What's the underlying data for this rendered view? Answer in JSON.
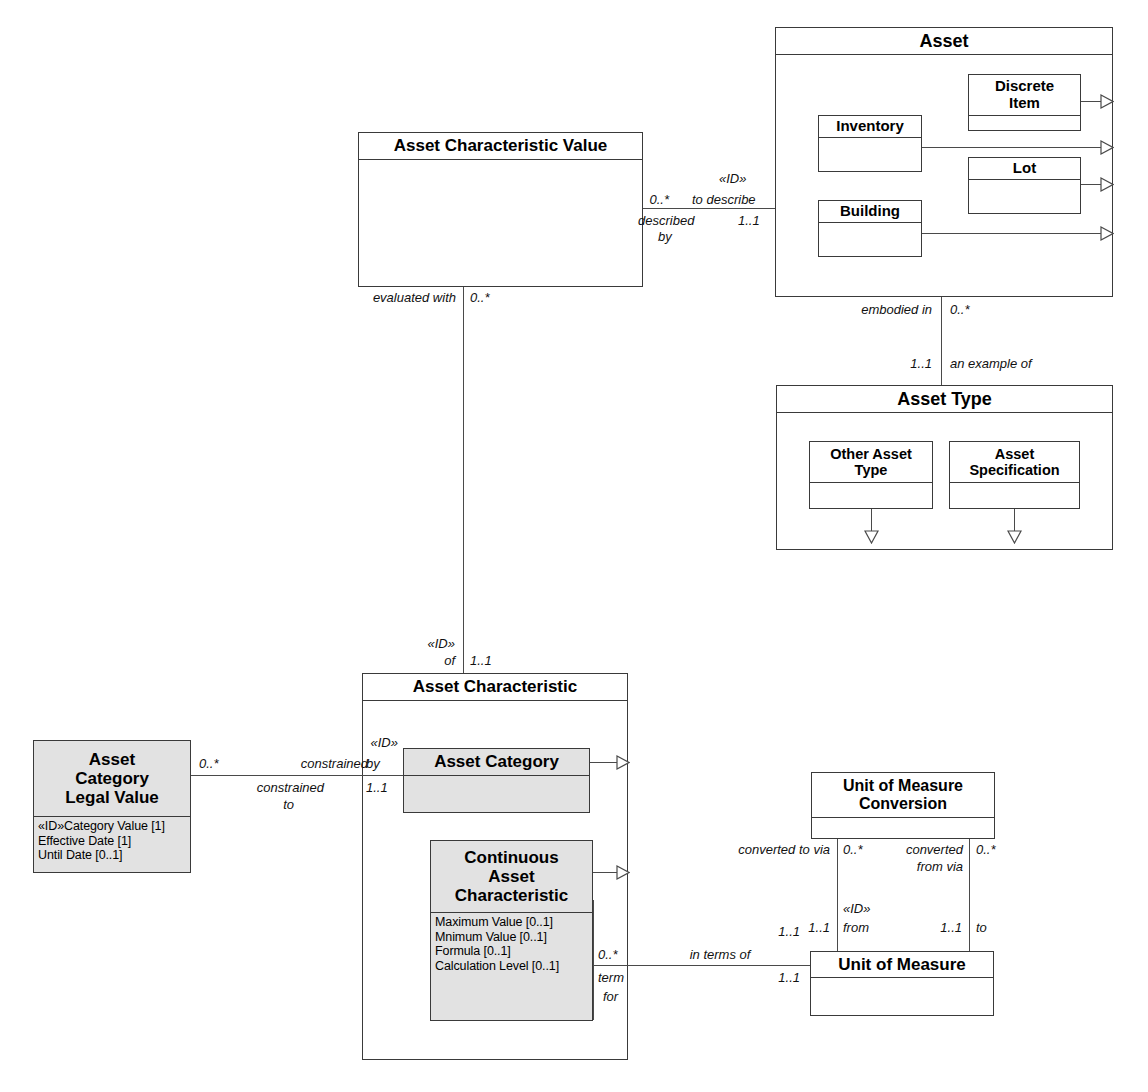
{
  "diagram": {
    "caption": "",
    "colors": {
      "line": "#4a4a4a",
      "shaded_fill": "#e2e2e2",
      "background": "#ffffff"
    }
  },
  "classes": {
    "asset": {
      "name": "Asset"
    },
    "inventory": {
      "name": "Inventory"
    },
    "discrete_item": {
      "name": "Discrete\nItem",
      "line1": "Discrete",
      "line2": "Item"
    },
    "lot": {
      "name": "Lot"
    },
    "building": {
      "name": "Building"
    },
    "asset_characteristic_value": {
      "name": "Asset Characteristic Value"
    },
    "asset_type": {
      "name": "Asset Type"
    },
    "other_asset_type": {
      "line1": "Other Asset",
      "line2": "Type"
    },
    "asset_specification": {
      "line1": "Asset",
      "line2": "Specification"
    },
    "asset_characteristic": {
      "name": "Asset Characteristic"
    },
    "asset_category": {
      "name": "Asset Category"
    },
    "continuous_asset_characteristic": {
      "line1": "Continuous",
      "line2": "Asset",
      "line3": "Characteristic",
      "attributes": [
        "Maximum Value [0..1]",
        "Mnimum Value [0..1]",
        "Formula [0..1]",
        "Calculation Level [0..1]"
      ]
    },
    "asset_category_legal_value": {
      "line1": "Asset",
      "line2": "Category",
      "line3": "Legal Value",
      "attributes": [
        "«ID»Category Value [1]",
        "Effective Date [1]",
        "Until Date [0..1]"
      ]
    },
    "unit_of_measure_conversion": {
      "line1": "Unit of Measure",
      "line2": "Conversion"
    },
    "unit_of_measure": {
      "name": "Unit of Measure"
    }
  },
  "associations": {
    "acv_to_asset": {
      "source_mult": "0..*",
      "source_role": "described\nby",
      "source_role_l1": "described",
      "source_role_l2": "by",
      "target_stereotype": "«ID»",
      "target_role": "to describe",
      "target_mult": "1..1"
    },
    "asset_to_asset_type": {
      "source_role": "embodied in",
      "source_mult": "0..*",
      "target_mult": "1..1",
      "target_role": "an example of"
    },
    "acv_to_ac": {
      "source_role": "evaluated with",
      "source_mult": "0..*",
      "target_stereotype": "«ID»",
      "target_role": "of",
      "target_mult": "1..1"
    },
    "aclv_to_ac": {
      "source_mult": "0..*",
      "source_role": "constrained",
      "target_stereotype": "«ID»",
      "target_role": "by",
      "target_mult": "1..1",
      "reverse_role_l1": "constrained",
      "reverse_role_l2": "to"
    },
    "cac_to_uom": {
      "source_mult": "0..*",
      "source_role_l1": "term",
      "source_role_l2": "for",
      "target_role": "in terms of",
      "target_mult_top": "1..1",
      "target_mult_bottom": "1..1"
    },
    "uomc_from_uom": {
      "left_role": "converted to via",
      "left_mult_top": "0..*",
      "left_mult_bottom": "1..1",
      "left_stereotype": "«ID»",
      "left_target_role": "from"
    },
    "uomc_to_uom": {
      "right_role_l1": "converted",
      "right_role_l2": "from via",
      "right_mult_top": "0..*",
      "right_mult_bottom": "1..1",
      "right_target_role": "to"
    }
  }
}
